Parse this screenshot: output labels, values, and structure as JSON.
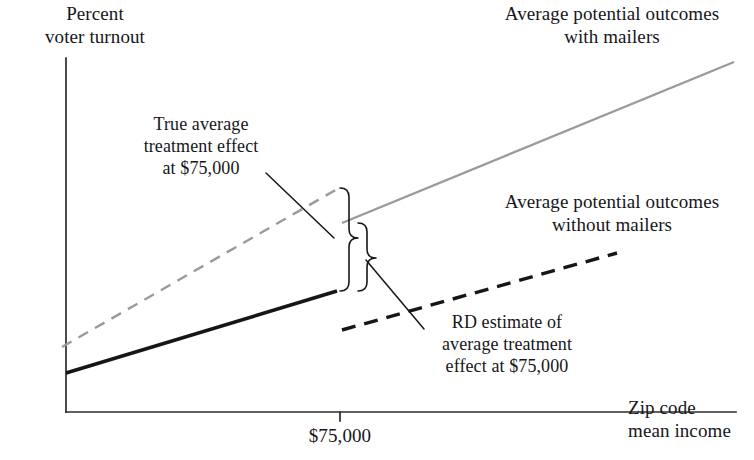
{
  "figure": {
    "background_color": "#ffffff",
    "ink_color": "#16161a",
    "treated_color": "#9a9a9a"
  },
  "axes": {
    "y_label": "Percent\nvoter turnout",
    "x_label": "Zip code\nmean income",
    "x_tick_label": "$75,000",
    "x_tick_value": 75000,
    "origin": {
      "x": 66,
      "y": 412
    },
    "y_axis_top": 58,
    "x_axis_right": 736,
    "cutoff_x_px": 340,
    "tick_length_px": 9
  },
  "annotations": {
    "true_ate": "True average\ntreatment effect\nat $75,000",
    "rd_ate": "RD estimate of\naverage treatment\neffect at $75,000",
    "with_mailers": "Average potential outcomes\nwith mailers",
    "without_mailers": "Average potential outcomes\nwithout mailers"
  },
  "chart_data": {
    "type": "line",
    "title": "",
    "xlabel": "Zip code mean income",
    "ylabel": "Percent voter turnout",
    "grid": false,
    "legend": "annotated-inline",
    "cutoff": {
      "label": "$75,000",
      "value": 75000,
      "x_px": 340
    },
    "axis_px": {
      "x_left": 66,
      "x_right": 736,
      "y_top": 58,
      "y_bottom": 412
    },
    "series": [
      {
        "name": "Average potential outcomes with mailers (counterfactual, below cutoff)",
        "style": "dashed",
        "color": "#9a9a9a",
        "width": 2.4,
        "points_px": [
          [
            62,
            347
          ],
          [
            339,
            188
          ]
        ]
      },
      {
        "name": "Average potential outcomes with mailers (observed, above cutoff)",
        "style": "solid",
        "color": "#9a9a9a",
        "width": 2.4,
        "points_px": [
          [
            342,
            223
          ],
          [
            734,
            62
          ]
        ]
      },
      {
        "name": "Average potential outcomes without mailers (observed, below cutoff)",
        "style": "solid",
        "color": "#16161a",
        "width": 3.6,
        "points_px": [
          [
            66,
            373
          ],
          [
            337,
            291
          ]
        ]
      },
      {
        "name": "Average potential outcomes without mailers (counterfactual, above cutoff)",
        "style": "dashed",
        "color": "#16161a",
        "width": 3.4,
        "points_px": [
          [
            342,
            330
          ],
          [
            617,
            253
          ]
        ]
      }
    ],
    "effects": [
      {
        "name": "True average treatment effect at $75,000",
        "brace": "tall-left",
        "x_px": 340,
        "y_top_px": 188,
        "y_bottom_px": 291,
        "pointer_y_px": 238,
        "magnitude_px": 103
      },
      {
        "name": "RD estimate of average treatment effect at $75,000",
        "brace": "short-right",
        "x_px": 358,
        "y_top_px": 223,
        "y_bottom_px": 291,
        "pointer_y_px": 258,
        "magnitude_px": 68
      }
    ],
    "leader_lines": [
      {
        "name": "true-ate-leader",
        "from_px": [
          266,
          173
        ],
        "to_px": [
          334,
          238
        ]
      },
      {
        "name": "rd-ate-leader",
        "from_px": [
          366,
          260
        ],
        "to_px": [
          424,
          329
        ]
      }
    ]
  }
}
